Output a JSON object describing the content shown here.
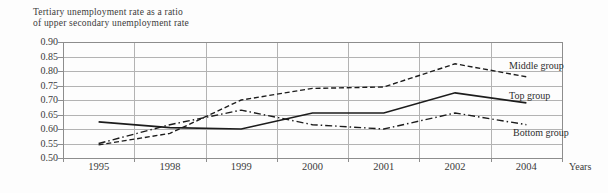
{
  "title": {
    "line1": "Tertiary unemployment rate as a ratio",
    "line2": "of upper secondary unemployment rate"
  },
  "chart_data": {
    "type": "line",
    "categories": [
      "1995",
      "1998",
      "1999",
      "2000",
      "2001",
      "2002",
      "2004"
    ],
    "xlabel": "Years",
    "ylabel": "",
    "ylim": [
      0.5,
      0.9
    ],
    "ytick_step": 0.05,
    "ytick_labels": [
      "0.90",
      "0.85",
      "0.80",
      "0.75",
      "0.70",
      "0.65",
      "0.60",
      "0.55",
      "0.50"
    ],
    "grid": true,
    "legend_position": "inline-right",
    "series": [
      {
        "name": "Middle group",
        "style": "dashed",
        "values": [
          0.545,
          0.585,
          0.7,
          0.74,
          0.745,
          0.825,
          0.78
        ]
      },
      {
        "name": "Top group",
        "style": "solid",
        "values": [
          0.625,
          0.605,
          0.6,
          0.655,
          0.655,
          0.725,
          0.69
        ]
      },
      {
        "name": "Bottom group",
        "style": "dash-dot",
        "values": [
          0.55,
          0.615,
          0.665,
          0.615,
          0.6,
          0.655,
          0.615
        ]
      }
    ]
  },
  "colors": {
    "line": "#1c1c1c",
    "grid": "#b3b3b3",
    "axis": "#8d8d8d",
    "text": "#3b3b3b",
    "background": "#fdfdfd"
  }
}
